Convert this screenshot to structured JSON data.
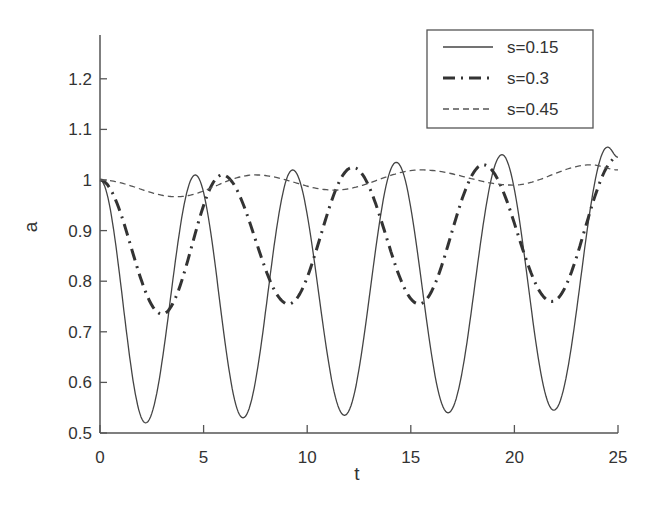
{
  "chart_data": {
    "type": "line",
    "title": "",
    "xlabel": "t",
    "ylabel": "a",
    "xlim": [
      0,
      25
    ],
    "ylim": [
      0.5,
      1.28
    ],
    "grid": false,
    "legend_position": "upper right",
    "x_ticks": [
      0,
      5,
      10,
      15,
      20,
      25
    ],
    "x_tick_labels": [
      "0",
      "5",
      "10",
      "15",
      "20",
      "25"
    ],
    "y_ticks": [
      0.5,
      0.6,
      0.7,
      0.8,
      0.9,
      1.0,
      1.1,
      1.2
    ],
    "y_tick_labels": [
      "0.5",
      "0.6",
      "0.7",
      "0.8",
      "0.9",
      "1",
      "1.1",
      "1.2"
    ],
    "series": [
      {
        "name": "s=0.15",
        "style": "solid",
        "color": "#444444",
        "width": 1.3,
        "x": [
          0,
          2.2,
          4.6,
          6.9,
          9.3,
          11.8,
          14.3,
          16.8,
          19.4,
          21.9,
          24.5,
          25
        ],
        "values": [
          1.0,
          0.52,
          1.01,
          0.53,
          1.02,
          0.535,
          1.035,
          0.54,
          1.05,
          0.545,
          1.065,
          1.045
        ]
      },
      {
        "name": "s=0.3",
        "style": "dashdot",
        "color": "#333333",
        "width": 3,
        "x": [
          0,
          3.0,
          5.9,
          9.1,
          12.2,
          15.4,
          18.5,
          21.8,
          25
        ],
        "values": [
          1.0,
          0.735,
          1.01,
          0.755,
          1.025,
          0.755,
          1.03,
          0.76,
          1.045
        ]
      },
      {
        "name": "s=0.45",
        "style": "dashed",
        "color": "#555555",
        "width": 1.3,
        "x": [
          0,
          3.7,
          7.5,
          11.3,
          15.5,
          19.9,
          23.7,
          25
        ],
        "values": [
          1.0,
          0.967,
          1.01,
          0.98,
          1.02,
          0.99,
          1.03,
          1.02
        ]
      }
    ]
  }
}
